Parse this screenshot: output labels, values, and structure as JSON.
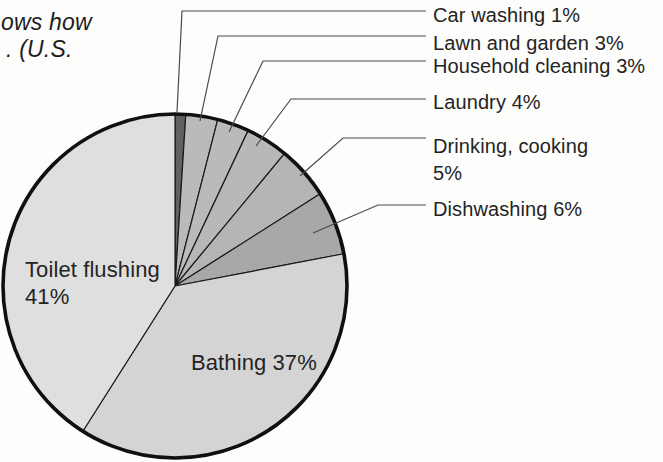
{
  "caption": {
    "lines": [
      "ows how",
      ". (U.S."
    ]
  },
  "chart_data": {
    "type": "pie",
    "unit": "%",
    "start_angle": "12-o-clock, clockwise",
    "categories": [
      "Car washing",
      "Lawn and garden",
      "Household cleaning",
      "Laundry",
      "Drinking, cooking",
      "Dishwashing",
      "Bathing",
      "Toilet flushing"
    ],
    "values": [
      1,
      3,
      3,
      4,
      5,
      6,
      37,
      41
    ],
    "slices": [
      {
        "label": "Car washing",
        "value": 1,
        "color": "#616161"
      },
      {
        "label": "Lawn and garden",
        "value": 3,
        "color": "#bababa"
      },
      {
        "label": "Household cleaning",
        "value": 3,
        "color": "#bababa"
      },
      {
        "label": "Laundry",
        "value": 4,
        "color": "#b8b8b8"
      },
      {
        "label": "Drinking, cooking",
        "value": 5,
        "color": "#b5b5b5"
      },
      {
        "label": "Dishwashing",
        "value": 6,
        "color": "#a8a8a8"
      },
      {
        "label": "Bathing",
        "value": 37,
        "color": "#d4d4d4"
      },
      {
        "label": "Toilet flushing",
        "value": 41,
        "color": "#dfdfdf"
      }
    ],
    "callouts": [
      {
        "lines": [
          "Car washing 1%"
        ],
        "leader": [
          [
            177,
            112
          ],
          [
            182,
            11
          ],
          [
            426,
            11
          ]
        ],
        "label_pos": [
          433,
          3
        ]
      },
      {
        "lines": [
          "Lawn and garden 3%"
        ],
        "leader": [
          [
            200,
            121
          ],
          [
            218,
            36
          ],
          [
            426,
            36
          ]
        ],
        "label_pos": [
          433,
          31
        ]
      },
      {
        "lines": [
          "Household cleaning 3%"
        ],
        "leader": [
          [
            229,
            132
          ],
          [
            263,
            61
          ],
          [
            426,
            61
          ]
        ],
        "label_pos": [
          433,
          54
        ]
      },
      {
        "lines": [
          "Laundry 4%"
        ],
        "leader": [
          [
            256,
            146
          ],
          [
            291,
            99
          ],
          [
            426,
            99
          ]
        ],
        "label_pos": [
          433,
          90
        ]
      },
      {
        "lines": [
          "Drinking, cooking",
          "5%"
        ],
        "leader": [
          [
            300,
            176
          ],
          [
            343,
            138
          ],
          [
            426,
            138
          ]
        ],
        "label_pos": [
          433,
          133
        ]
      },
      {
        "lines": [
          "Dishwashing 6%"
        ],
        "leader": [
          [
            313,
            233
          ],
          [
            378,
            205
          ],
          [
            426,
            205
          ]
        ],
        "label_pos": [
          433,
          197
        ]
      }
    ],
    "inner_labels": [
      {
        "lines": [
          "Toilet flushing",
          "41%"
        ],
        "pos": [
          25,
          256
        ]
      },
      {
        "lines": [
          "Bathing 37%"
        ],
        "pos": [
          191,
          349
        ]
      }
    ],
    "geometry": {
      "cx": 175,
      "cy": 286,
      "r": 172
    },
    "style": {
      "rim_color": "#101010",
      "rim_width": 3.6,
      "divider_color": "#1b1b1b",
      "divider_width": 1.2,
      "leader_color": "#4a4a4a",
      "leader_width": 1.2
    },
    "legend_position": "none",
    "grid": false
  }
}
